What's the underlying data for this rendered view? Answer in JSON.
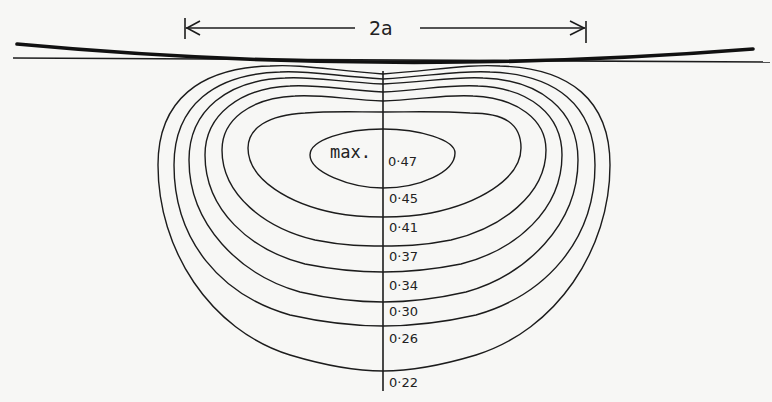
{
  "figure": {
    "dimension_label": "2a",
    "max_label": "max.",
    "contour_labels": [
      "0·47",
      "0·45",
      "0·41",
      "0·37",
      "0·34",
      "0·30",
      "0·26",
      "0·22"
    ]
  },
  "colors": {
    "background": "#f7f7f5",
    "ink": "#1c1c1c"
  }
}
